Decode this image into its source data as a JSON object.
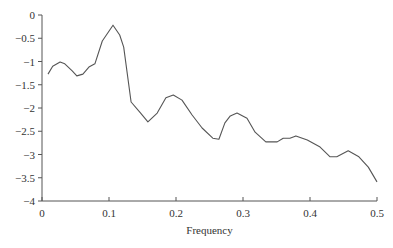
{
  "chart_data": {
    "type": "line",
    "title": "",
    "xlabel": "Frequency",
    "ylabel": "",
    "xlim": [
      0,
      0.5
    ],
    "ylim": [
      -4,
      0
    ],
    "grid": false,
    "legend": null,
    "x_ticks": [
      "0",
      "0.1",
      "0.2",
      "0.3",
      "0.4",
      "0.5"
    ],
    "x_tick_values": [
      0,
      0.1,
      0.2,
      0.3,
      0.4,
      0.5
    ],
    "y_ticks": [
      "0",
      "-0.5",
      "-1",
      "-1.5",
      "-2",
      "-2.5",
      "-3",
      "-3.5",
      "-4"
    ],
    "y_tick_values": [
      0,
      -0.5,
      -1,
      -1.5,
      -2,
      -2.5,
      -3,
      -3.5,
      -4
    ],
    "series": [
      {
        "name": "spectrum",
        "color": "#555555",
        "x": [
          0.009,
          0.016,
          0.027,
          0.034,
          0.045,
          0.052,
          0.061,
          0.07,
          0.079,
          0.09,
          0.106,
          0.116,
          0.122,
          0.133,
          0.146,
          0.158,
          0.172,
          0.185,
          0.196,
          0.209,
          0.224,
          0.239,
          0.255,
          0.264,
          0.273,
          0.281,
          0.291,
          0.306,
          0.318,
          0.334,
          0.351,
          0.36,
          0.37,
          0.379,
          0.396,
          0.415,
          0.43,
          0.44,
          0.457,
          0.473,
          0.487,
          0.5
        ],
        "values": [
          -1.27,
          -1.1,
          -1.01,
          -1.05,
          -1.2,
          -1.31,
          -1.27,
          -1.12,
          -1.05,
          -0.56,
          -0.22,
          -0.43,
          -0.69,
          -1.87,
          -2.09,
          -2.3,
          -2.11,
          -1.78,
          -1.72,
          -1.83,
          -2.15,
          -2.43,
          -2.65,
          -2.67,
          -2.32,
          -2.17,
          -2.11,
          -2.22,
          -2.52,
          -2.73,
          -2.73,
          -2.65,
          -2.65,
          -2.6,
          -2.69,
          -2.84,
          -3.05,
          -3.05,
          -2.92,
          -3.05,
          -3.27,
          -3.59
        ]
      }
    ]
  }
}
